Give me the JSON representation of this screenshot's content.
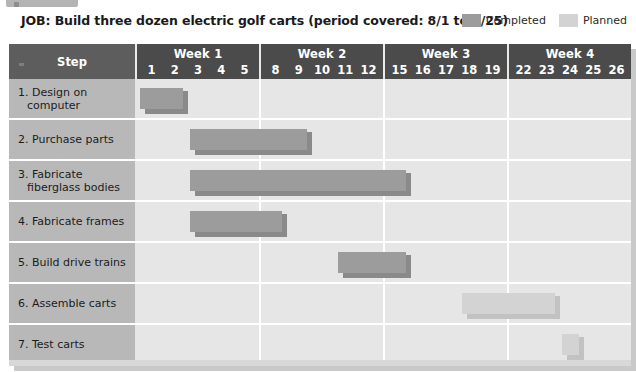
{
  "title": "JOB: Build three dozen electric golf carts (period covered: 8/1 to 8/25)",
  "legend": {
    "completed": {
      "label": "Completed",
      "color": "#9c9c9c"
    },
    "planned": {
      "label": "Planned",
      "color": "#d3d3d3"
    }
  },
  "table": {
    "step_header": "Step",
    "weeks": [
      {
        "label": "Week 1",
        "days": [
          "1",
          "2",
          "3",
          "4",
          "5"
        ]
      },
      {
        "label": "Week 2",
        "days": [
          "8",
          "9",
          "10",
          "11",
          "12"
        ]
      },
      {
        "label": "Week 3",
        "days": [
          "15",
          "16",
          "17",
          "18",
          "19"
        ]
      },
      {
        "label": "Week 4",
        "days": [
          "22",
          "23",
          "24",
          "25",
          "26"
        ]
      }
    ],
    "rows": [
      {
        "step": "1. Design on computer"
      },
      {
        "step": "2. Purchase parts"
      },
      {
        "step": "3. Fabricate fiberglass bodies"
      },
      {
        "step": "4. Fabricate frames"
      },
      {
        "step": "5. Build drive trains"
      },
      {
        "step": "6. Assemble carts"
      },
      {
        "step": "7. Test carts"
      }
    ]
  },
  "chart_data": {
    "type": "bar",
    "title": "JOB: Build three dozen electric golf carts (period covered: 8/1 to 8/25)",
    "xlabel": "",
    "ylabel": "Step",
    "orientation": "horizontal",
    "subtype": "gantt",
    "grid": true,
    "legend_position": "top-right",
    "categories": [
      "1. Design on computer",
      "2. Purchase parts",
      "3. Fabricate fiberglass bodies",
      "4. Fabricate frames",
      "5. Build drive trains",
      "6. Assemble carts",
      "7. Test carts"
    ],
    "x_tick_labels": [
      "1",
      "2",
      "3",
      "4",
      "5",
      "8",
      "9",
      "10",
      "11",
      "12",
      "15",
      "16",
      "17",
      "18",
      "19",
      "22",
      "23",
      "24",
      "25",
      "26"
    ],
    "x_groups": [
      "Week 1",
      "Week 2",
      "Week 3",
      "Week 4"
    ],
    "series": [
      {
        "name": "Completed",
        "color": "#9c9c9c"
      },
      {
        "name": "Planned",
        "color": "#d3d3d3"
      }
    ],
    "bars": [
      {
        "row": 0,
        "step": "1. Design on computer",
        "series": "Completed",
        "start_day": "1",
        "end_day": "2",
        "start_index": 0,
        "span": 2
      },
      {
        "row": 1,
        "step": "2. Purchase parts",
        "series": "Completed",
        "start_day": "3",
        "end_day": "9",
        "start_index": 2,
        "span": 5
      },
      {
        "row": 2,
        "step": "3. Fabricate fiberglass bodies",
        "series": "Completed",
        "start_day": "3",
        "end_day": "16",
        "start_index": 2,
        "span": 9
      },
      {
        "row": 3,
        "step": "4. Fabricate frames",
        "series": "Completed",
        "start_day": "3",
        "end_day": "8",
        "start_index": 2,
        "span": 4
      },
      {
        "row": 4,
        "step": "5. Build drive trains",
        "series": "Completed",
        "start_day": "11",
        "end_day": "16",
        "start_index": 8,
        "span": 3
      },
      {
        "row": 5,
        "step": "6. Assemble carts",
        "series": "Planned",
        "start_day": "18",
        "end_day": "22",
        "start_index": 13,
        "span": 4
      },
      {
        "row": 6,
        "step": "7. Test carts",
        "series": "Planned",
        "start_day": "24",
        "end_day": "24",
        "start_index": 17,
        "span": 1
      }
    ]
  }
}
